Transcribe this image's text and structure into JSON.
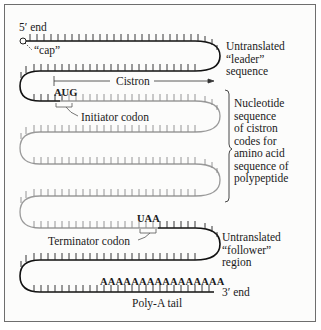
{
  "labels": {
    "five_prime_end": "5′ end",
    "cap": "“cap”",
    "leader": "Untranslated\n“leader”\nsequence",
    "cistron": "Cistron",
    "aug": "AUG",
    "initiator_codon": "Initiator codon",
    "coding_description": "Nucleotide\nsequence\nof cistron\ncodes for\namino acid\nsequence of\npolypeptide",
    "uaa": "UAA",
    "terminator_codon": "Terminator codon",
    "follower": "Untranslated\n“follower”\nregion",
    "poly_a_sequence": "AAAAAAAAAAAAAAAA",
    "three_prime_end": "3′ end",
    "poly_a_tail": "Poly-A tail"
  },
  "colors": {
    "untranslated_strand": "#111111",
    "coding_strand": "#9a9a9a",
    "text": "#1a1a1a",
    "border": "#6e6e6e"
  }
}
